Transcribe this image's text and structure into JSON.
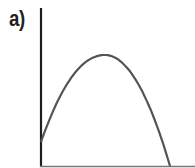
{
  "figure": {
    "panel_label": "a)",
    "colors": {
      "axis": "#1e1e1e",
      "curve": "#555555",
      "background": "#ffffff"
    },
    "axes": {
      "origin": [
        41,
        166
      ],
      "y_axis_top": 8,
      "x_axis_right": 195
    },
    "curve": {
      "shape": "inverted-parabola",
      "start": [
        41,
        142
      ],
      "peak": [
        105,
        55
      ],
      "end": [
        170,
        166
      ]
    }
  }
}
